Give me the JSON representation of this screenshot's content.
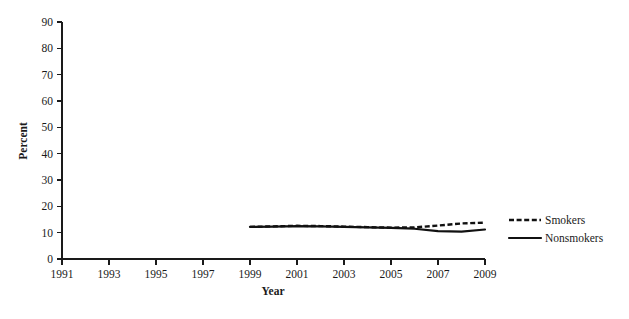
{
  "chart_data": {
    "type": "line",
    "title": "",
    "xlabel": "Year",
    "ylabel": "Percent",
    "xlim": [
      1991,
      2009
    ],
    "ylim": [
      0,
      90
    ],
    "grid": false,
    "legend_position": "right",
    "x_ticks": [
      "1991",
      "1993",
      "1995",
      "1997",
      "1999",
      "2001",
      "2003",
      "2005",
      "2007",
      "2009"
    ],
    "x_tick_values": [
      1991,
      1993,
      1995,
      1997,
      1999,
      2001,
      2003,
      2005,
      2007,
      2009
    ],
    "y_ticks": [
      "0",
      "10",
      "20",
      "30",
      "40",
      "50",
      "60",
      "70",
      "80",
      "90"
    ],
    "y_tick_values": [
      0,
      10,
      20,
      30,
      40,
      50,
      60,
      70,
      80,
      90
    ],
    "x": [
      1999,
      2000,
      2001,
      2002,
      2003,
      2004,
      2005,
      2006,
      2007,
      2008,
      2009
    ],
    "series": [
      {
        "name": "Smokers",
        "style": "dashed",
        "color": "#111111",
        "values": [
          12.2,
          12.4,
          12.6,
          12.5,
          12.3,
          12.1,
          11.9,
          12.0,
          12.7,
          13.5,
          13.8
        ]
      },
      {
        "name": "Nonsmokers",
        "style": "solid",
        "color": "#111111",
        "values": [
          12.2,
          12.3,
          12.5,
          12.4,
          12.2,
          12.0,
          11.8,
          11.5,
          10.6,
          10.4,
          11.2
        ]
      }
    ]
  },
  "legend": {
    "entries": [
      {
        "label": "Smokers",
        "style": "dashed"
      },
      {
        "label": "Nonsmokers",
        "style": "solid"
      }
    ]
  },
  "axes": {
    "y_axis_title": "Percent",
    "x_axis_title": "Year"
  }
}
